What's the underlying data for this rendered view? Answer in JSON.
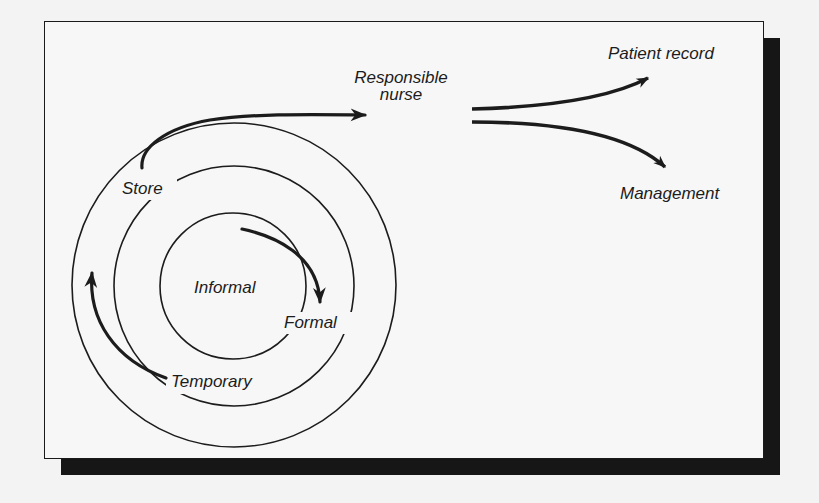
{
  "diagram": {
    "colors": {
      "background": "#f3f3f3",
      "ink": "#1c1c1c",
      "shadow": "#161616"
    },
    "circles": [
      {
        "id": "inner",
        "label": "Informal"
      },
      {
        "id": "middle",
        "label": "Formal"
      },
      {
        "id": "outer",
        "label": "Temporary"
      }
    ],
    "labels": {
      "informal": "Informal",
      "formal": "Formal",
      "temporary": "Temporary",
      "store": "Store",
      "responsible_line1": "Responsible",
      "responsible_line2": "nurse",
      "patient_record": "Patient record",
      "management": "Management"
    },
    "arrows": [
      {
        "from": "Informal",
        "to": "Formal"
      },
      {
        "from": "Temporary",
        "to": "Store"
      },
      {
        "from": "Store",
        "to": "Responsible nurse"
      },
      {
        "from": "Responsible nurse",
        "to": "Patient record"
      },
      {
        "from": "Responsible nurse",
        "to": "Management"
      }
    ]
  }
}
